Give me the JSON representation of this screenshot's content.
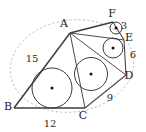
{
  "figure": {
    "type": "geometry-diagram",
    "vertices": [
      {
        "name": "A",
        "label": "A",
        "x": 70,
        "y": 33,
        "label_x": 64,
        "label_y": 27
      },
      {
        "name": "B",
        "label": "B",
        "x": 14,
        "y": 108,
        "label_x": 8,
        "label_y": 110
      },
      {
        "name": "C",
        "label": "C",
        "x": 85,
        "y": 108,
        "label_x": 83,
        "label_y": 119
      },
      {
        "name": "D",
        "label": "D",
        "x": 126,
        "y": 75,
        "label_x": 129,
        "label_y": 79
      },
      {
        "name": "E",
        "label": "E",
        "x": 124,
        "y": 40,
        "label_x": 129,
        "label_y": 41
      },
      {
        "name": "F",
        "label": "F",
        "x": 113,
        "y": 22,
        "label_x": 112,
        "label_y": 17
      }
    ],
    "side_labels": [
      {
        "name": "side-AB",
        "value": "15",
        "x": 32,
        "y": 62
      },
      {
        "name": "side-BC",
        "value": "12",
        "x": 50,
        "y": 127
      },
      {
        "name": "side-CD",
        "value": "9",
        "x": 110,
        "y": 101
      },
      {
        "name": "side-DE",
        "value": "6",
        "x": 133,
        "y": 58
      },
      {
        "name": "side-EF",
        "value": "3",
        "x": 124,
        "y": 29
      }
    ],
    "circumcircle": {
      "name": "circumscribed-ellipse",
      "cx": 72,
      "cy": 66,
      "rx": 62,
      "ry": 46,
      "rotation": -8,
      "style": "dashed"
    },
    "incircles": [
      {
        "name": "incircle-ABC",
        "cx": 52,
        "cy": 88,
        "r": 20.0
      },
      {
        "name": "incircle-ACD",
        "cx": 91,
        "cy": 74,
        "r": 16.5
      },
      {
        "name": "incircle-ADE",
        "cx": 113,
        "cy": 48,
        "r": 10.0
      },
      {
        "name": "incircle-AEF",
        "cx": 116,
        "cy": 28,
        "r": 6.0
      }
    ],
    "polygon_edges": [
      {
        "name": "edge-AB",
        "from": "A",
        "to": "B"
      },
      {
        "name": "edge-BC",
        "from": "B",
        "to": "C"
      },
      {
        "name": "edge-CD",
        "from": "C",
        "to": "D"
      },
      {
        "name": "edge-DE",
        "from": "D",
        "to": "E"
      },
      {
        "name": "edge-EF",
        "from": "E",
        "to": "F"
      },
      {
        "name": "edge-FA",
        "from": "F",
        "to": "A"
      }
    ],
    "diagonals": [
      {
        "name": "diagonal-AC",
        "from": "A",
        "to": "C"
      },
      {
        "name": "diagonal-AD",
        "from": "A",
        "to": "D"
      },
      {
        "name": "diagonal-AE",
        "from": "A",
        "to": "E"
      }
    ],
    "colors": {
      "stroke": "#4a4a4a",
      "edge_strong": "#3d3d3d",
      "dashed": "#b9b9b9",
      "text": "#1a1a1a",
      "dot": "#111111",
      "background": "#ffffff"
    }
  }
}
